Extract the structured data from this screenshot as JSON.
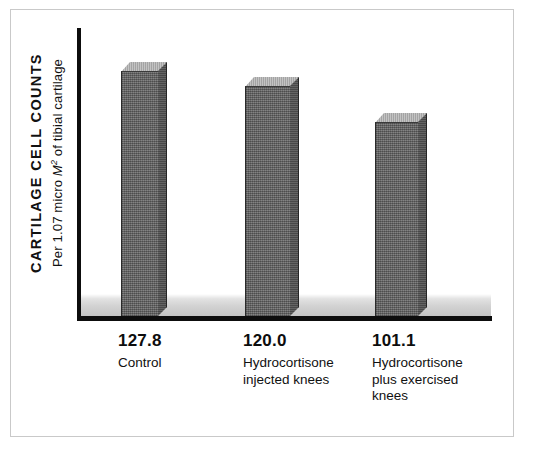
{
  "chart_data": {
    "type": "bar",
    "title": "",
    "xlabel": "",
    "ylabel": "CARTILAGE CELL COUNTS",
    "ylabel_sub": "Per 1.07 micro M2 of tibial cartilage",
    "categories": [
      "Control",
      "Hydrocortisone injected knees",
      "Hydrocortisone plus exercised knees"
    ],
    "values": [
      127.8,
      120.0,
      101.1
    ],
    "value_labels": [
      "127.8",
      "120.0",
      "101.1"
    ],
    "ylim": [
      0,
      140
    ],
    "grid": false,
    "legend": "none",
    "bar_style": "3d-block",
    "colors": {
      "bar_front": "#6a6a6a",
      "bar_side": "#5a5a5a",
      "bar_top": "#b6b6b6",
      "axis": "#0d0d0d",
      "floor": "#c4c4c4",
      "frame": "#c9c9c9",
      "background": "#ffffff",
      "text": "#111111"
    }
  },
  "axis_title": {
    "main": "CARTILAGE CELL COUNTS",
    "sub_pre": "Per 1.07 micro ",
    "sub_unit": "M",
    "sub_sup": "2",
    "sub_post": " of tibial cartilage"
  },
  "categories": [
    {
      "value": "127.8",
      "name": "Control"
    },
    {
      "value": "120.0",
      "name": "Hydrocortisone\ninjected knees"
    },
    {
      "value": "101.1",
      "name": "Hydrocortisone\nplus exercised\nknees"
    }
  ]
}
